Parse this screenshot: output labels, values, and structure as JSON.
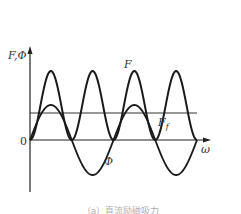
{
  "chart_data": {
    "type": "line",
    "title": "",
    "xlabel": "ω",
    "ylabel": "F,Φ",
    "origin_label": "0",
    "grid": false,
    "legend": "none (inline labels)",
    "series": [
      {
        "name": "F",
        "description": "periodic positive waveform (rectified-sine-squared shape), touching zero between peaks",
        "x": [
          0,
          0.5,
          1,
          1.5,
          2,
          2.5,
          3,
          3.5,
          4
        ],
        "values": [
          0,
          1,
          0,
          1,
          0,
          1,
          0,
          1,
          0
        ],
        "peak_value": 1.0,
        "min_value": 0
      },
      {
        "name": "Φ",
        "description": "sinusoid centered on zero, half the frequency of F",
        "x": [
          0,
          0.5,
          1,
          1.5,
          2,
          2.5,
          3,
          3.5,
          4
        ],
        "values": [
          0,
          0.5,
          0,
          -0.5,
          0,
          0.5,
          0,
          -0.5,
          0
        ],
        "amplitude": 0.5
      },
      {
        "name": "F_f",
        "description": "constant horizontal line (average force)",
        "x": [
          0,
          4
        ],
        "values": [
          0.39,
          0.39
        ]
      }
    ],
    "annotations": [
      "F",
      "Φ",
      "F_f",
      "0",
      "ω",
      "F,Φ"
    ],
    "xlim": [
      0,
      4.6
    ],
    "ylim": [
      -0.75,
      1.3
    ]
  },
  "labels": {
    "y_axis": "F,Φ",
    "x_axis": "ω",
    "origin": "0",
    "curve_F": "F",
    "curve_Phi": "Φ",
    "curve_Ff_main": "F",
    "curve_Ff_sub": "f"
  },
  "caption": "（a）直流励磁吸力"
}
